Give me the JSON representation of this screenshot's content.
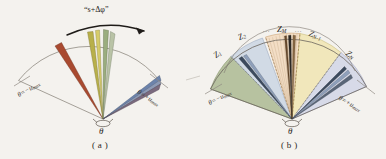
{
  "figure": {
    "background_color": "#f4f2ee",
    "ink_color": "#2a2723"
  },
  "panel_a": {
    "caption": "( a )",
    "arc_label": "“s+Δφ”",
    "angle_left": "θ=−u",
    "angle_left_sub": "max",
    "angle_right": "θ=+u",
    "angle_right_sub": "max",
    "pivot_label": "θ",
    "rays": [
      {
        "name": "ray-red",
        "angle_deg": -52,
        "color": "#a94a30",
        "width": 5.5,
        "length": 74
      },
      {
        "name": "ray-olive",
        "angle_deg": -10,
        "color": "#b8b04a",
        "width": 5.0,
        "length": 86
      },
      {
        "name": "ray-yellow",
        "angle_deg": -4,
        "color": "#d6cc6a",
        "width": 4.0,
        "length": 88
      },
      {
        "name": "ray-green",
        "angle_deg": 3,
        "color": "#9aad7e",
        "width": 5.0,
        "length": 88
      },
      {
        "name": "ray-sage",
        "angle_deg": 9,
        "color": "#b9c3a6",
        "width": 4.5,
        "length": 84
      },
      {
        "name": "ray-blue",
        "angle_deg": 54,
        "color": "#6c83ab",
        "width": 5.0,
        "length": 72
      },
      {
        "name": "ray-steel",
        "angle_deg": 59,
        "color": "#8d9ab5",
        "width": 4.0,
        "length": 70
      },
      {
        "name": "ray-purple",
        "angle_deg": 63,
        "color": "#7a6a7e",
        "width": 5.0,
        "length": 68
      }
    ]
  },
  "panel_b": {
    "caption": "( b )",
    "angle_left": "θ=−u",
    "angle_left_sub": "max",
    "angle_right": "θ=+u",
    "angle_right_sub": "max",
    "pivot_label": "θ",
    "zones": [
      {
        "name": "zone-z1",
        "label": "Z",
        "sub": "1",
        "color": "#9fae82",
        "start_deg": -72,
        "end_deg": -44
      },
      {
        "name": "zone-z2",
        "label": "Z",
        "sub": "2",
        "color": "#c3d0e2",
        "start_deg": -44,
        "end_deg": -16
      },
      {
        "name": "zone-zm",
        "label": "Z",
        "sub": "M",
        "color": "#f3d9bd",
        "start_deg": -13,
        "end_deg": 11
      },
      {
        "name": "zone-zn1",
        "label": "Z",
        "sub": "N-1",
        "color": "#f0e4ad",
        "start_deg": 11,
        "end_deg": 42
      },
      {
        "name": "zone-zn",
        "label": "Z",
        "sub": "N",
        "color": "#ccd0e6",
        "start_deg": 42,
        "end_deg": 72
      }
    ],
    "zm_dots_left": "∙∙∙",
    "zm_dots_right": "∙∙∙",
    "rays": [
      {
        "name": "ray-b-1",
        "angle_deg": -40,
        "color": "#3c4a5e",
        "width": 2.6,
        "length": 78
      },
      {
        "name": "ray-b-2",
        "angle_deg": -36,
        "color": "#8fa0bb",
        "width": 2.4,
        "length": 78
      },
      {
        "name": "ray-b-3",
        "angle_deg": -5,
        "color": "#6a4a2c",
        "width": 2.2,
        "length": 84
      },
      {
        "name": "ray-b-4",
        "angle_deg": -1,
        "color": "#2e2a26",
        "width": 2.4,
        "length": 86
      },
      {
        "name": "ray-b-5",
        "angle_deg": 3,
        "color": "#8a6a45",
        "width": 2.2,
        "length": 84
      },
      {
        "name": "ray-b-6",
        "angle_deg": 45,
        "color": "#3c4a5e",
        "width": 2.4,
        "length": 74
      },
      {
        "name": "ray-b-7",
        "angle_deg": 49,
        "color": "#8fa0bb",
        "width": 2.4,
        "length": 73
      },
      {
        "name": "ray-b-8",
        "angle_deg": 54,
        "color": "#5a6678",
        "width": 2.4,
        "length": 71
      }
    ]
  },
  "footer": {
    "cropped_text": ""
  }
}
